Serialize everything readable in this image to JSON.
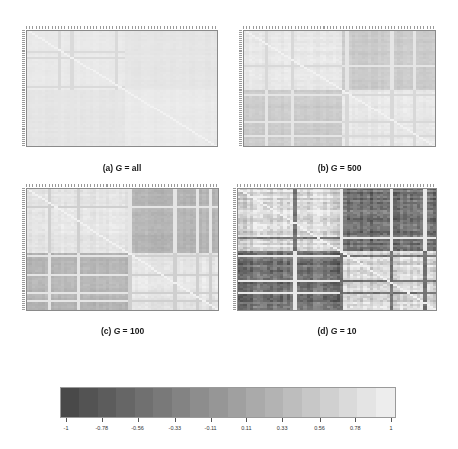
{
  "chart_data": {
    "type": "heatmap",
    "title": "",
    "panels": [
      {
        "id": "a",
        "caption_prefix": "(a) ",
        "caption_var": "G",
        "caption_suffix": " = all",
        "n": 60,
        "block_split": 0.52,
        "within_value": 0.9,
        "between_value": 0.85,
        "noise": 0.03,
        "v_bands": [
          0.17,
          0.23,
          0.47
        ],
        "h_bands": [
          0.18,
          0.24,
          0.48
        ],
        "band_value": 0.72
      },
      {
        "id": "b",
        "caption_prefix": "(b) ",
        "caption_var": "G",
        "caption_suffix": " = 500",
        "n": 60,
        "block_split": 0.52,
        "within_value": 0.88,
        "between_value": 0.55,
        "noise": 0.07,
        "v_bands": [
          0.12,
          0.25,
          0.53,
          0.76,
          0.88
        ],
        "h_bands": [
          0.3,
          0.55,
          0.78,
          0.9
        ],
        "band_value": 0.7
      },
      {
        "id": "c",
        "caption_prefix": "(c) ",
        "caption_var": "G",
        "caption_suffix": " = 100",
        "n": 60,
        "block_split": 0.53,
        "within_value": 0.85,
        "between_value": 0.3,
        "noise": 0.09,
        "v_bands": [
          0.12,
          0.27,
          0.54,
          0.77,
          0.89,
          0.95
        ],
        "h_bands": [
          0.15,
          0.55,
          0.7,
          0.85,
          0.92
        ],
        "band_value": 0.6
      },
      {
        "id": "d",
        "caption_prefix": "(d) ",
        "caption_var": "G",
        "caption_suffix": " = 10",
        "n": 60,
        "block_split": 0.52,
        "within_value": 0.7,
        "between_value": -0.45,
        "noise": 0.35,
        "v_bands": [
          0.28,
          0.52,
          0.77,
          0.93
        ],
        "h_bands": [
          0.4,
          0.55,
          0.75,
          0.85
        ],
        "band_value": 0.1
      }
    ],
    "colorbar": {
      "min": -1,
      "max": 1,
      "colormap": "grayscale, dark (#444) at -1 to near-white (#f2f2f2) at 1",
      "tick_labels": [
        "-1",
        "-0.78",
        "-0.56",
        "-0.33",
        "-0.11",
        "0.11",
        "0.33",
        "0.56",
        "0.78",
        "1"
      ],
      "tick_values": [
        -1,
        -0.78,
        -0.56,
        -0.33,
        -0.11,
        0.11,
        0.33,
        0.56,
        0.78,
        1
      ],
      "steps": 18
    },
    "xlabel": "",
    "ylabel": "",
    "grid": false,
    "legend_position": "bottom"
  },
  "colors": {
    "low": "#444444",
    "high": "#f2f2f2",
    "frame": "#8a8a8a"
  }
}
